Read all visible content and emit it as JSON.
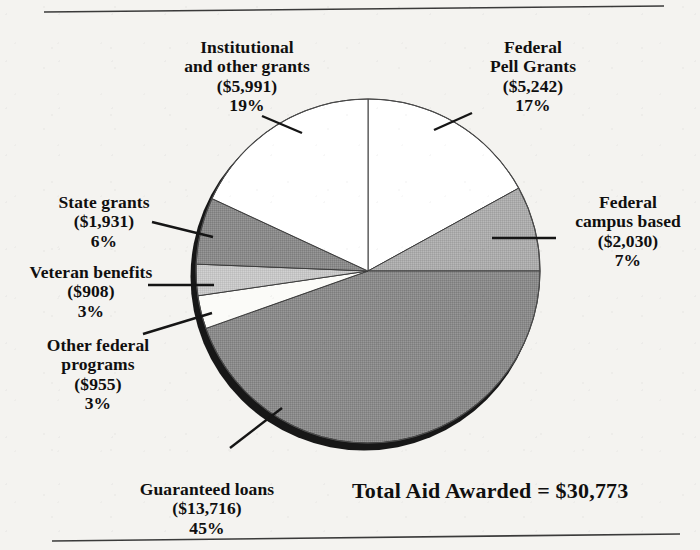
{
  "figure": {
    "total_label": "Total Aid Awarded = $30,773",
    "rule_color": "#3a3a3a",
    "background": "#f4f3f0"
  },
  "chart_data": {
    "type": "pie",
    "title": "",
    "subtitle": "",
    "xlabel": "",
    "ylabel": "",
    "legend_position": "callouts",
    "grid": false,
    "total_value": 30773,
    "total_label": "Total Aid Awarded = $30,773",
    "value_prefix": "$",
    "start_angle_deg": 0,
    "direction": "clockwise",
    "center": {
      "x": 368,
      "y": 271
    },
    "radius": 172,
    "shadow_offset": {
      "x": -4,
      "y": 6
    },
    "categories": [
      "Federal Pell Grants",
      "Federal campus based",
      "Guaranteed loans",
      "Other federal programs",
      "Veteran benefits",
      "State grants",
      "Institutional and other grants"
    ],
    "values": [
      5242,
      2030,
      13716,
      955,
      908,
      1931,
      5991
    ],
    "percents": [
      17,
      7,
      45,
      3,
      3,
      6,
      19
    ],
    "slices": [
      {
        "name": "Federal Pell Grants",
        "label_line1": "Federal",
        "label_line2": "Pell Grants",
        "value_text": "($5,242)",
        "percent_text": "17%",
        "value": 5242,
        "percent": 17,
        "fill": "#ffffff",
        "start_deg": 0,
        "end_deg": 61.2
      },
      {
        "name": "Federal campus based",
        "label_line1": "Federal",
        "label_line2": "campus based",
        "value_text": "($2,030)",
        "percent_text": "7%",
        "value": 2030,
        "percent": 7,
        "fill": "#a9a9a9",
        "start_deg": 61.2,
        "end_deg": 90.0
      },
      {
        "name": "Guaranteed loans",
        "label_line1": "Guaranteed loans",
        "label_line2": "",
        "value_text": "($13,716)",
        "percent_text": "45%",
        "value": 13716,
        "percent": 45,
        "fill": "#8a8a8a",
        "start_deg": 90.0,
        "end_deg": 250.5
      },
      {
        "name": "Other federal programs",
        "label_line1": "Other federal",
        "label_line2": "programs",
        "value_text": "($955)",
        "percent_text": "3%",
        "value": 955,
        "percent": 3,
        "fill": "#fbfbf8",
        "start_deg": 250.5,
        "end_deg": 261.7
      },
      {
        "name": "Veteran benefits",
        "label_line1": "Veteran benefits",
        "label_line2": "",
        "value_text": "($908)",
        "percent_text": "3%",
        "value": 908,
        "percent": 3,
        "fill": "#c3c3c3",
        "start_deg": 261.7,
        "end_deg": 272.3
      },
      {
        "name": "State grants",
        "label_line1": "State grants",
        "label_line2": "",
        "value_text": "($1,931)",
        "percent_text": "6%",
        "value": 1931,
        "percent": 6,
        "fill": "#8f8f8f",
        "start_deg": 272.3,
        "end_deg": 294.9
      },
      {
        "name": "Institutional and other grants",
        "label_line1": "Institutional",
        "label_line2": "and other grants",
        "value_text": "($5,991)",
        "percent_text": "19%",
        "value": 5991,
        "percent": 19,
        "fill": "#ffffff",
        "start_deg": 294.9,
        "end_deg": 360
      }
    ]
  },
  "callouts": {
    "institutional": {
      "text": "Institutional\nand other grants\n($5,991)\n19%",
      "x": 152,
      "y": 38,
      "width": 190
    },
    "pell": {
      "text": "Federal\nPell Grants\n($5,242)\n17%",
      "x": 448,
      "y": 38,
      "width": 170
    },
    "campus": {
      "text": "Federal\ncampus based\n($2,030)\n7%",
      "x": 556,
      "y": 193,
      "width": 144
    },
    "state": {
      "text": "State grants\n($1,931)\n6%",
      "x": 28,
      "y": 193,
      "width": 152
    },
    "veteran": {
      "text": "Veteran benefits\n($908)\n3%",
      "x": 8,
      "y": 263,
      "width": 166
    },
    "other_federal": {
      "text": "Other federal\nprograms\n($955)\n3%",
      "x": 22,
      "y": 336,
      "width": 152
    },
    "guaranteed": {
      "text": "Guaranteed loans\n($13,716)\n45%",
      "x": 112,
      "y": 480,
      "width": 190
    }
  },
  "leader_lines": [
    {
      "name": "leader-institutional",
      "x1": 262,
      "y1": 116,
      "x2": 302,
      "y2": 133
    },
    {
      "name": "leader-pell",
      "x1": 434,
      "y1": 130,
      "x2": 472,
      "y2": 113
    },
    {
      "name": "leader-campus",
      "x1": 492,
      "y1": 238,
      "x2": 556,
      "y2": 238
    },
    {
      "name": "leader-state",
      "x1": 152,
      "y1": 222,
      "x2": 213,
      "y2": 237
    },
    {
      "name": "leader-veteran",
      "x1": 148,
      "y1": 285,
      "x2": 214,
      "y2": 285
    },
    {
      "name": "leader-other-federal",
      "x1": 143,
      "y1": 334,
      "x2": 212,
      "y2": 313
    },
    {
      "name": "leader-guaranteed",
      "x1": 230,
      "y1": 448,
      "x2": 282,
      "y2": 408
    }
  ],
  "rules": [
    {
      "name": "top-rule",
      "x1": 44,
      "y1": 12,
      "x2": 664,
      "y2": 6
    },
    {
      "name": "bottom-rule",
      "x1": 52,
      "y1": 541,
      "x2": 680,
      "y2": 534
    }
  ],
  "total": {
    "text": "Total Aid Awarded = $30,773",
    "x": 352,
    "y": 478
  }
}
